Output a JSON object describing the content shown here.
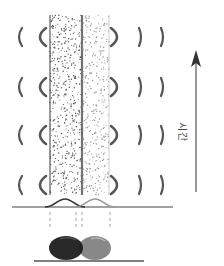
{
  "figure": {
    "type": "diffusion-band-diagram",
    "axis": {
      "label": "시간",
      "direction": "up",
      "color": "#555555"
    },
    "bands": [
      {
        "name": "dark-band",
        "x": 50,
        "width": 32,
        "color": "#555555",
        "edge_color": "#444444"
      },
      {
        "name": "light-band",
        "x": 82,
        "width": 27,
        "color": "#999999",
        "edge_color": "#888888"
      }
    ],
    "wave_rows_y": [
      37,
      87,
      135,
      185
    ],
    "left_brackets_x": [
      19,
      40
    ],
    "right_brackets_x": [
      117,
      141,
      163
    ],
    "peaks": [
      {
        "name": "dark-peak",
        "center": 65,
        "color": "#333333"
      },
      {
        "name": "light-peak",
        "center": 95,
        "color": "#999999"
      }
    ],
    "particles": [
      {
        "name": "dark-particle",
        "cx": 66,
        "cy": 248,
        "rx": 17,
        "ry": 12,
        "color": "#1e1e1e"
      },
      {
        "name": "gray-particle",
        "cx": 95,
        "cy": 248,
        "rx": 16,
        "ry": 12,
        "color": "#888888"
      }
    ]
  }
}
